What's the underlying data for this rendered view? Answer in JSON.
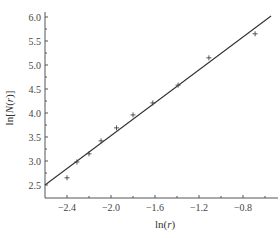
{
  "chart_data": {
    "type": "scatter",
    "title": "",
    "xlabel": "ln(r)",
    "ylabel": "ln[N(r)]",
    "xlim": [
      -2.6,
      -0.48
    ],
    "ylim": [
      2.25,
      6.0
    ],
    "x_ticks": [
      -2.4,
      -2.0,
      -1.6,
      -1.2,
      -0.8
    ],
    "x_tick_labels": [
      "−2.4",
      "−2.0",
      "−1.6",
      "−1.2",
      "−0.8"
    ],
    "x_minor_ticks": [
      -2.2,
      -1.8,
      -1.4,
      -1.0,
      -0.6
    ],
    "y_ticks": [
      2.5,
      3.0,
      3.5,
      4.0,
      4.5,
      5.0,
      5.5,
      6.0
    ],
    "y_tick_labels": [
      "2.5",
      "3.0",
      "3.5",
      "4.0",
      "4.5",
      "5.0",
      "5.5",
      "6.0"
    ],
    "grid": false,
    "legend": null,
    "series": [
      {
        "name": "data",
        "marker": "+",
        "points": [
          {
            "x": -2.4,
            "y": 2.65
          },
          {
            "x": -2.31,
            "y": 2.98
          },
          {
            "x": -2.2,
            "y": 3.15
          },
          {
            "x": -2.09,
            "y": 3.42
          },
          {
            "x": -1.95,
            "y": 3.69
          },
          {
            "x": -1.8,
            "y": 3.96
          },
          {
            "x": -1.62,
            "y": 4.21
          },
          {
            "x": -1.39,
            "y": 4.58
          },
          {
            "x": -1.11,
            "y": 5.15
          },
          {
            "x": -0.69,
            "y": 5.65
          }
        ]
      },
      {
        "name": "linear fit",
        "type": "line",
        "points": [
          {
            "x": -2.6,
            "y": 2.5
          },
          {
            "x": -0.545,
            "y": 6.02
          }
        ]
      }
    ]
  },
  "colors": {
    "axis": "#555555",
    "line": "#333333",
    "marker": "#444444"
  }
}
